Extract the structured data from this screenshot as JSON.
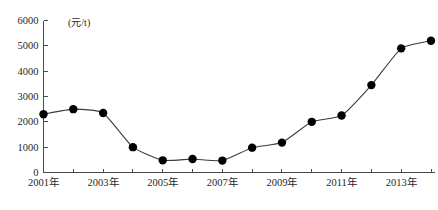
{
  "chart_data": {
    "type": "line",
    "title": "",
    "subtitle": "",
    "xlabel": "",
    "ylabel": "",
    "unit_label": "(元/t)",
    "x": [
      2001,
      2002,
      2003,
      2004,
      2005,
      2006,
      2007,
      2008,
      2009,
      2010,
      2011,
      2012,
      2013,
      2014
    ],
    "categories": [
      "2001年",
      "2002年",
      "2003年",
      "2004年",
      "2005年",
      "2006年",
      "2007年",
      "2008年",
      "2009年",
      "2010年",
      "2011年",
      "2012年",
      "2013年",
      "2014年"
    ],
    "values": [
      2300,
      2500,
      2350,
      1000,
      480,
      530,
      470,
      980,
      1180,
      2000,
      2250,
      3450,
      4900,
      5200
    ],
    "series": [
      {
        "name": "价格",
        "values": [
          2300,
          2500,
          2350,
          1000,
          480,
          530,
          470,
          980,
          1180,
          2000,
          2250,
          3450,
          4900,
          5200
        ]
      }
    ],
    "ylim": [
      0,
      6000
    ],
    "xlim": [
      2001,
      2014
    ],
    "ytick_values": [
      0,
      1000,
      2000,
      3000,
      4000,
      5000,
      6000
    ],
    "ytick_labels": [
      "0",
      "1000",
      "2000",
      "3000",
      "4000",
      "5000",
      "6000"
    ],
    "xtick_values": [
      2001,
      2002,
      2003,
      2004,
      2005,
      2006,
      2007,
      2008,
      2009,
      2010,
      2011,
      2012,
      2013,
      2014
    ],
    "xtick_labels": [
      "2001年",
      "",
      "2003年",
      "",
      "2005年",
      "",
      "2007年",
      "",
      "2009年",
      "",
      "2011年",
      "",
      "2013年",
      ""
    ],
    "grid": false,
    "legend": false,
    "legend_position": "none",
    "marker": "filled-circle",
    "marker_color": "#000000",
    "line_color": "#3b3b3b",
    "axis_color": "#4a4a4a",
    "background_color": "#ffffff",
    "annotations": []
  }
}
